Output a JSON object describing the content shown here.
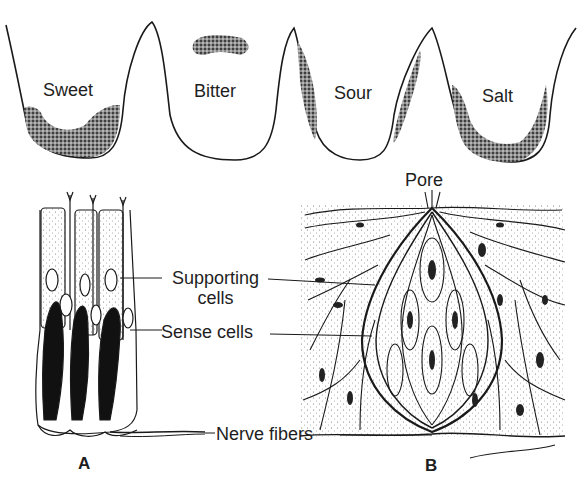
{
  "figure": {
    "top_panel": {
      "description": "Tongue papillae cross-sections showing taste zones",
      "regions": [
        {
          "label": "Sweet",
          "zone": "bottom of trough"
        },
        {
          "label": "Bitter",
          "zone": "isolated patch above trough"
        },
        {
          "label": "Sour",
          "zone": "side walls of trough"
        },
        {
          "label": "Salt",
          "zone": "bottom and lower sides of trough"
        }
      ]
    },
    "panel_a": {
      "letter": "A",
      "description": "Longitudinal view of taste bud cells"
    },
    "panel_b": {
      "letter": "B",
      "description": "Taste bud embedded in epithelium",
      "pore_label": "Pore"
    },
    "shared_labels": {
      "supporting_line1": "Supporting",
      "supporting_line2": "cells",
      "sense_cells": "Sense cells",
      "nerve_fibers": "Nerve fibers"
    },
    "colors": {
      "ink": "#1a1a1a",
      "stipple": "#555555",
      "background": "#ffffff"
    }
  }
}
